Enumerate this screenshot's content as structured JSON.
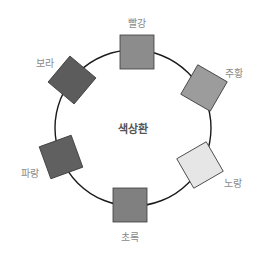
{
  "diagram": {
    "title": "색상환",
    "circle": {
      "cx": 133,
      "cy": 128,
      "r": 78,
      "stroke": "#1a1a1a"
    },
    "swatches": [
      {
        "label": "빨강",
        "fill": "#8c8c8c",
        "cx": 137,
        "cy": 52,
        "rotate": 0,
        "label_x": 137,
        "label_y": 22
      },
      {
        "label": "주황",
        "fill": "#9c9c9c",
        "cx": 204,
        "cy": 88,
        "rotate": 30,
        "label_x": 234,
        "label_y": 72
      },
      {
        "label": "노랑",
        "fill": "#e6e6e6",
        "cx": 200,
        "cy": 165,
        "rotate": -30,
        "label_x": 233,
        "label_y": 182
      },
      {
        "label": "초록",
        "fill": "#808080",
        "cx": 130,
        "cy": 205,
        "rotate": 0,
        "label_x": 130,
        "label_y": 236
      },
      {
        "label": "파랑",
        "fill": "#606060",
        "cx": 61,
        "cy": 157,
        "rotate": -20,
        "label_x": 30,
        "label_y": 172
      },
      {
        "label": "보라",
        "fill": "#5c5c5c",
        "cx": 72,
        "cy": 80,
        "rotate": 40,
        "label_x": 45,
        "label_y": 62
      }
    ],
    "swatch_size": 34
  }
}
